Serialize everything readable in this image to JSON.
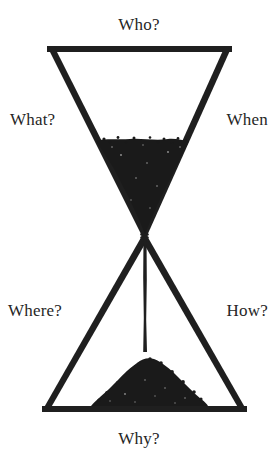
{
  "figure": {
    "title_implicit": "Hourglass of questions",
    "background_color": "#ffffff",
    "ink_color": "#1c1c1c",
    "sand_color": "#1a1a1a"
  },
  "labels": {
    "top": "Who?",
    "left_upper": "What?",
    "right_upper": "When",
    "left_lower": "Where?",
    "right_lower": "How?",
    "bottom": "Why?"
  },
  "shape": {
    "name": "hourglass",
    "top_bar": {
      "x1": 48,
      "x2": 231,
      "y": 49
    },
    "bottom_bar": {
      "x1": 43,
      "x2": 246,
      "y": 409
    },
    "waist": {
      "x": 144,
      "y": 235
    },
    "upper_sand_surface_y": 141,
    "lower_pile_peak_y": 358,
    "stream_x": 145
  }
}
